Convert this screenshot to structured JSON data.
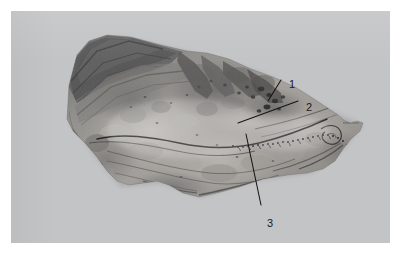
{
  "figure": {
    "kind": "anatomical-specimen-photograph",
    "modality": "grayscale photograph",
    "orientation": "lateral / sagittal section, specimen facing right",
    "page_background": "#ffffff",
    "plate_background": "#c3c4c6",
    "label_color": "#1b1b1b",
    "leader_line_color": "#141414"
  },
  "callouts": [
    {
      "id": "1",
      "label": "1",
      "x": 283,
      "y": 74,
      "leader_from": [
        281,
        80
      ],
      "leader_to": [
        268,
        101
      ]
    },
    {
      "id": "2",
      "label": "2",
      "x": 300,
      "y": 97,
      "leader_from": [
        295,
        101
      ],
      "leader_to": [
        238,
        123
      ]
    },
    {
      "id": "3",
      "label": "3",
      "x": 261,
      "y": 214,
      "leader_from": [
        261,
        205
      ],
      "leader_to": [
        246,
        134
      ]
    }
  ],
  "specimen": {
    "tone_darkest": "#4a4a4c",
    "tone_dark": "#6d6d6e",
    "tone_mid": "#8e8d8b",
    "tone_light": "#a9a7a3",
    "tone_lightest": "#bcb9b4",
    "features": [
      "overlapping dark tissue flaps at upper left",
      "broad pale mid-body with mottled texture",
      "dark curved ridge line crossing the mid-body",
      "stippled / serrated suture line on the right half",
      "cluster of dark foramina in the upper right region",
      "pointed bony process at the right apex",
      "irregular notched inferior margin"
    ]
  }
}
